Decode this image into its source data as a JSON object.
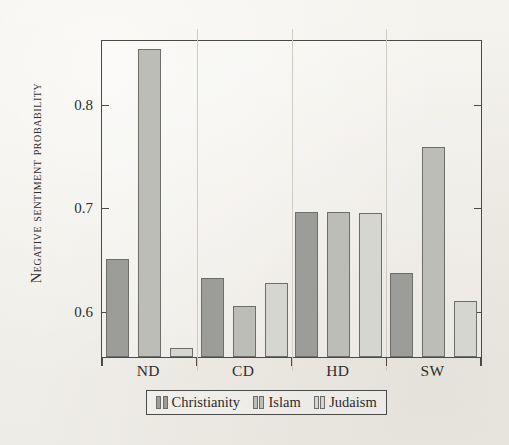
{
  "chart_data": {
    "type": "bar",
    "title": "",
    "xlabel": "",
    "ylabel": "Negative sentiment probability",
    "categories": [
      "ND",
      "CD",
      "HD",
      "SW"
    ],
    "series": [
      {
        "name": "Christianity",
        "color": "#9c9c98",
        "values": [
          0.652,
          0.633,
          0.697,
          0.638
        ]
      },
      {
        "name": "Islam",
        "color": "#bdbdb8",
        "values": [
          0.854,
          0.606,
          0.697,
          0.76
        ]
      },
      {
        "name": "Judaism",
        "color": "#d6d6d1",
        "values": [
          0.566,
          0.628,
          0.696,
          0.611
        ]
      }
    ],
    "ylim": [
      0.557,
      0.862
    ],
    "yticks": [
      0.6,
      0.7,
      0.8
    ],
    "ytick_labels": [
      "0.6",
      "0.7",
      "0.8"
    ],
    "grid": false,
    "legend_position": "below-axis"
  },
  "axis": {
    "y_title": "Negative sentiment probability",
    "tick_0": "0.6",
    "tick_1": "0.7",
    "tick_2": "0.8"
  },
  "categories": {
    "c0": "ND",
    "c1": "CD",
    "c2": "HD",
    "c3": "SW"
  },
  "legend": {
    "items": [
      {
        "label": "Christianity"
      },
      {
        "label": "Islam"
      },
      {
        "label": "Judaism"
      }
    ]
  }
}
